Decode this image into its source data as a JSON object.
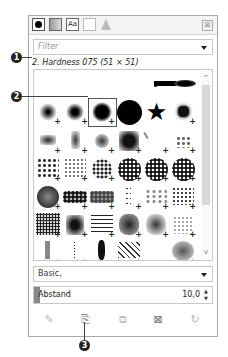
{
  "tabs": [
    {
      "name": "brushes",
      "icon": "brush-icon",
      "active": true
    },
    {
      "name": "patterns",
      "icon": "pattern-icon"
    },
    {
      "name": "fonts",
      "icon": "font-icon",
      "label": "Aa"
    },
    {
      "name": "document-history",
      "icon": "document-icon"
    },
    {
      "name": "gradients",
      "icon": "gradient-icon"
    }
  ],
  "tab_menu_icon": "⊠",
  "filter": {
    "placeholder": "Filter"
  },
  "selected_brush": "2. Hardness 075 (51 × 51)",
  "brush_grid": {
    "columns": 6,
    "selected_index": 8,
    "scroll": {
      "up": "^",
      "down": "v"
    }
  },
  "preset_dropdown": {
    "value": "Basic,"
  },
  "spacing": {
    "label": "Abstand",
    "value": "10,0",
    "spin_up": "▲",
    "spin_down": "▼"
  },
  "actions": [
    {
      "name": "edit-brush",
      "glyph": "✎"
    },
    {
      "name": "new-brush",
      "glyph": "⎘"
    },
    {
      "name": "duplicate-brush",
      "glyph": "⧉"
    },
    {
      "name": "delete-brush",
      "glyph": "⊠"
    },
    {
      "name": "refresh-brushes",
      "glyph": "↻"
    }
  ],
  "callouts": [
    "1",
    "2",
    "3"
  ]
}
